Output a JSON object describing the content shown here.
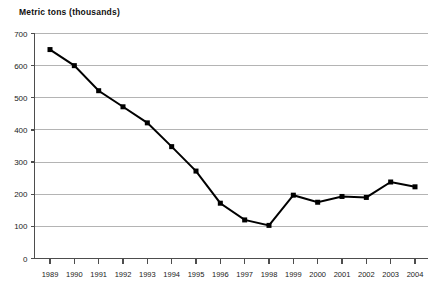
{
  "chart_data": {
    "type": "line",
    "title": "Metric tons (thousands)",
    "xlabel": "",
    "ylabel": "Metric tons (thousands)",
    "categories": [
      "1989",
      "1990",
      "1991",
      "1992",
      "1993",
      "1994",
      "1995",
      "1996",
      "1997",
      "1998",
      "1999",
      "2000",
      "2001",
      "2002",
      "2003",
      "2004"
    ],
    "values": [
      650,
      600,
      522,
      472,
      422,
      348,
      272,
      172,
      120,
      103,
      197,
      175,
      193,
      190,
      238,
      223
    ],
    "series": [
      {
        "name": "Metric tons (thousands)",
        "values": [
          650,
          600,
          522,
          472,
          422,
          348,
          272,
          172,
          120,
          103,
          197,
          175,
          193,
          190,
          238,
          223
        ]
      }
    ],
    "ylim": [
      0,
      700
    ],
    "yticks": [
      0,
      100,
      200,
      300,
      400,
      500,
      600,
      700
    ],
    "ytick_labels": [
      "0",
      "100",
      "200",
      "300",
      "400",
      "500",
      "600",
      "700"
    ],
    "grid": true,
    "grid_axis": "y",
    "legend": false,
    "marker": "square",
    "line_color": "#000000",
    "marker_color": "#000000",
    "grid_color": "#b4b4b4",
    "axis_color": "#4d4d4d",
    "background": "#ffffff"
  }
}
